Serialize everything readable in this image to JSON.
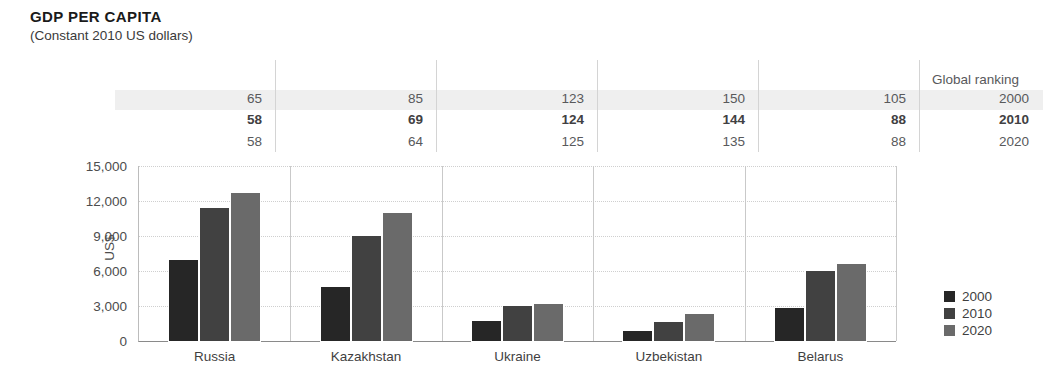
{
  "header": {
    "title": "GDP PER CAPITA",
    "subtitle": "(Constant 2010 US dollars)"
  },
  "ranking": {
    "header_label": "Global ranking",
    "years": [
      "2000",
      "2010",
      "2020"
    ],
    "highlight_year": "2010",
    "countries": [
      "Russia",
      "Kazakhstan",
      "Ukraine",
      "Uzbekistan",
      "Belarus"
    ],
    "rows": [
      {
        "year": "2000",
        "values": [
          "65",
          "85",
          "123",
          "150",
          "105"
        ]
      },
      {
        "year": "2010",
        "values": [
          "58",
          "69",
          "124",
          "144",
          "88"
        ]
      },
      {
        "year": "2020",
        "values": [
          "58",
          "64",
          "125",
          "135",
          "88"
        ]
      }
    ]
  },
  "chart_data": {
    "type": "bar",
    "title": "GDP PER CAPITA",
    "subtitle": "(Constant 2010 US dollars)",
    "xlabel": "",
    "ylabel": "US$",
    "ylim": [
      0,
      15000
    ],
    "yticks": [
      "0",
      "3,000",
      "6,000",
      "9,000",
      "12,000",
      "15,000"
    ],
    "ytick_values": [
      0,
      3000,
      6000,
      9000,
      12000,
      15000
    ],
    "grid": true,
    "legend_position": "right",
    "categories": [
      "Russia",
      "Kazakhstan",
      "Ukraine",
      "Uzbekistan",
      "Belarus"
    ],
    "series": [
      {
        "name": "2000",
        "color": "#262626",
        "values": [
          6950,
          4600,
          1750,
          900,
          2800
        ]
      },
      {
        "name": "2010",
        "color": "#414141",
        "values": [
          11400,
          9000,
          3000,
          1600,
          6000
        ]
      },
      {
        "name": "2020",
        "color": "#6a6a6a",
        "values": [
          12700,
          11000,
          3150,
          2350,
          6600
        ]
      }
    ]
  },
  "legend": {
    "items": [
      {
        "label": "2000",
        "color": "#262626"
      },
      {
        "label": "2010",
        "color": "#414141"
      },
      {
        "label": "2020",
        "color": "#6a6a6a"
      }
    ]
  },
  "colors": {
    "series_2000": "#262626",
    "series_2010": "#414141",
    "series_2020": "#6a6a6a",
    "highlight_band": "#efefef",
    "gridline": "#cfcfcf",
    "axis": "#8a8a8a"
  }
}
